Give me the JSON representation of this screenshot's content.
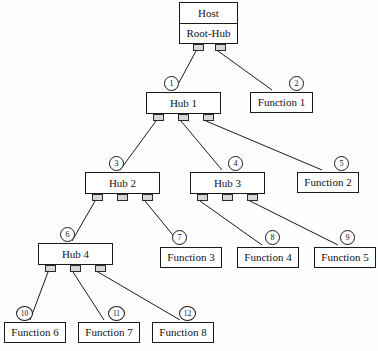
{
  "diagram": {
    "type": "tree",
    "colors": {
      "background": "#fdfdfd",
      "node_fill": "#ffffff",
      "stroke": "#1a1a1a",
      "port_fill": "#d7d7d7",
      "text": "#111111"
    },
    "nodes": [
      {
        "id": "host",
        "label": "Host",
        "sublabel": "Root-Hub",
        "kind": "host",
        "x": 179,
        "y": 2,
        "w": 59,
        "h": 42,
        "ports": [
          {
            "x": 193,
            "y": 44
          },
          {
            "x": 215,
            "y": 44
          }
        ]
      },
      {
        "id": "hub1",
        "label": "Hub 1",
        "kind": "hub",
        "x": 146,
        "y": 92,
        "w": 75,
        "h": 22,
        "ports": [
          {
            "x": 153,
            "y": 114
          },
          {
            "x": 178,
            "y": 114
          },
          {
            "x": 203,
            "y": 114
          }
        ]
      },
      {
        "id": "hub2",
        "label": "Hub 2",
        "kind": "hub",
        "x": 85,
        "y": 172,
        "w": 75,
        "h": 22,
        "ports": [
          {
            "x": 92,
            "y": 194
          },
          {
            "x": 117,
            "y": 194
          },
          {
            "x": 142,
            "y": 194
          }
        ]
      },
      {
        "id": "hub3",
        "label": "Hub 3",
        "kind": "hub",
        "x": 190,
        "y": 172,
        "w": 75,
        "h": 22,
        "ports": [
          {
            "x": 197,
            "y": 194
          },
          {
            "x": 222,
            "y": 194
          },
          {
            "x": 247,
            "y": 194
          }
        ]
      },
      {
        "id": "hub4",
        "label": "Hub 4",
        "kind": "hub",
        "x": 38,
        "y": 243,
        "w": 75,
        "h": 22,
        "ports": [
          {
            "x": 45,
            "y": 265
          },
          {
            "x": 70,
            "y": 265
          },
          {
            "x": 95,
            "y": 265
          }
        ]
      },
      {
        "id": "func1",
        "label": "Function 1",
        "kind": "function",
        "x": 250,
        "y": 92,
        "w": 63,
        "h": 21,
        "ports": []
      },
      {
        "id": "func2",
        "label": "Function 2",
        "kind": "function",
        "x": 297,
        "y": 172,
        "w": 62,
        "h": 21,
        "ports": []
      },
      {
        "id": "func3",
        "label": "Function 3",
        "kind": "function",
        "x": 160,
        "y": 247,
        "w": 62,
        "h": 21,
        "ports": []
      },
      {
        "id": "func4",
        "label": "Function 4",
        "kind": "function",
        "x": 237,
        "y": 247,
        "w": 62,
        "h": 21,
        "ports": []
      },
      {
        "id": "func5",
        "label": "Function 5",
        "kind": "function",
        "x": 314,
        "y": 247,
        "w": 62,
        "h": 21,
        "ports": []
      },
      {
        "id": "func6",
        "label": "Function 6",
        "kind": "function",
        "x": 4,
        "y": 322,
        "w": 62,
        "h": 21,
        "ports": []
      },
      {
        "id": "func7",
        "label": "Function 7",
        "kind": "function",
        "x": 78,
        "y": 322,
        "w": 62,
        "h": 21,
        "ports": []
      },
      {
        "id": "func8",
        "label": "Function 8",
        "kind": "function",
        "x": 152,
        "y": 322,
        "w": 62,
        "h": 21,
        "ports": []
      }
    ],
    "edges": [
      {
        "from": "host",
        "to": "hub1",
        "x1": 196,
        "y1": 51,
        "x2": 175,
        "y2": 90
      },
      {
        "from": "host",
        "to": "func1",
        "x1": 218,
        "y1": 51,
        "x2": 272,
        "y2": 90
      },
      {
        "from": "hub1",
        "to": "hub2",
        "x1": 156,
        "y1": 121,
        "x2": 120,
        "y2": 170
      },
      {
        "from": "hub1",
        "to": "hub3",
        "x1": 181,
        "y1": 121,
        "x2": 222,
        "y2": 170
      },
      {
        "from": "hub1",
        "to": "func2",
        "x1": 206,
        "y1": 121,
        "x2": 322,
        "y2": 170
      },
      {
        "from": "hub2",
        "to": "hub4",
        "x1": 95,
        "y1": 201,
        "x2": 72,
        "y2": 241
      },
      {
        "from": "hub2",
        "to": "func3",
        "x1": 145,
        "y1": 201,
        "x2": 181,
        "y2": 245
      },
      {
        "from": "hub3",
        "to": "func4",
        "x1": 200,
        "y1": 201,
        "x2": 262,
        "y2": 245
      },
      {
        "from": "hub3",
        "to": "func5",
        "x1": 250,
        "y1": 201,
        "x2": 338,
        "y2": 245
      },
      {
        "from": "hub4",
        "to": "func6",
        "x1": 48,
        "y1": 272,
        "x2": 30,
        "y2": 320
      },
      {
        "from": "hub4",
        "to": "func7",
        "x1": 73,
        "y1": 272,
        "x2": 104,
        "y2": 320
      },
      {
        "from": "hub4",
        "to": "func8",
        "x1": 98,
        "y1": 272,
        "x2": 180,
        "y2": 320
      }
    ],
    "bubbles": [
      {
        "label": "1",
        "x": 164,
        "y": 76,
        "target": "hub1"
      },
      {
        "label": "2",
        "x": 289,
        "y": 76,
        "target": "func1"
      },
      {
        "label": "3",
        "x": 109,
        "y": 156,
        "target": "hub2"
      },
      {
        "label": "4",
        "x": 228,
        "y": 156,
        "target": "hub3"
      },
      {
        "label": "5",
        "x": 334,
        "y": 156,
        "target": "func2"
      },
      {
        "label": "6",
        "x": 60,
        "y": 227,
        "target": "hub4"
      },
      {
        "label": "7",
        "x": 172,
        "y": 230,
        "target": "func3"
      },
      {
        "label": "8",
        "x": 265,
        "y": 230,
        "target": "func4"
      },
      {
        "label": "9",
        "x": 340,
        "y": 230,
        "target": "func5"
      },
      {
        "label": "10",
        "x": 16,
        "y": 306,
        "target": "func6"
      },
      {
        "label": "11",
        "x": 108,
        "y": 306,
        "target": "func7"
      },
      {
        "label": "12",
        "x": 179,
        "y": 306,
        "target": "func8"
      }
    ]
  }
}
